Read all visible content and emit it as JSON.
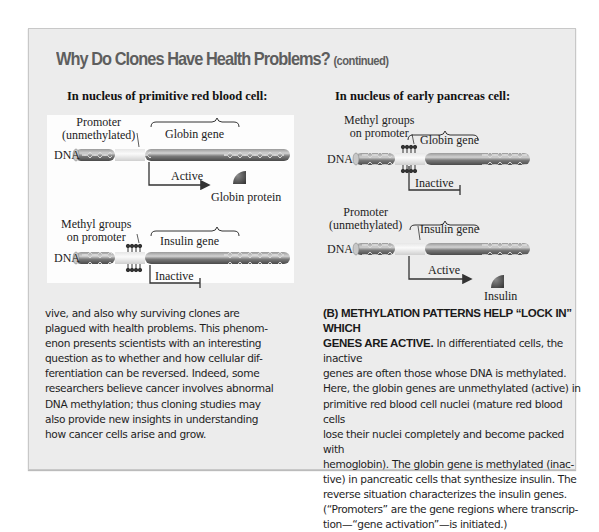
{
  "page": {
    "title": "Why Do Clones Have Health Problems?",
    "title_suffix": "(continued)"
  },
  "figure": {
    "left": {
      "heading": "In nucleus of primitive red blood cell:",
      "top_strand": {
        "dna_label": "DNA",
        "promoter_label_line1": "Promoter",
        "promoter_label_line2": "(unmethylated)",
        "gene_label": "Globin gene",
        "state_label": "Active",
        "product_label": "Globin protein",
        "methylated": false
      },
      "bottom_strand": {
        "dna_label": "DNA",
        "promoter_label_line1": "Methyl groups",
        "promoter_label_line2": "on promoter",
        "gene_label": "Insulin gene",
        "state_label": "Inactive",
        "methylated": true
      }
    },
    "right": {
      "heading": "In nucleus of early pancreas cell:",
      "top_strand": {
        "dna_label": "DNA",
        "promoter_label_line1": "Methyl groups",
        "promoter_label_line2": "on promoter",
        "gene_label": "Globin gene",
        "state_label": "Inactive",
        "methylated": true
      },
      "bottom_strand": {
        "dna_label": "DNA",
        "promoter_label_line1": "Promoter",
        "promoter_label_line2": "(unmethylated)",
        "gene_label": "Insulin gene",
        "state_label": "Active",
        "product_label": "Insulin",
        "methylated": false
      }
    }
  },
  "body_left": {
    "lines": [
      "vive, and also why surviving clones are",
      "plagued with health problems. This phenom-",
      "enon presents scientists with an interesting",
      "question as to whether and how cellular dif-",
      "ferentiation can be reversed. Indeed, some",
      "researchers believe cancer involves abnormal",
      "DNA methylation; thus cloning studies may",
      "also provide new insights in understanding",
      "how cancer cells arise and grow."
    ]
  },
  "caption_right": {
    "heading_line1": "(B) METHYLATION PATTERNS HELP “LOCK IN” WHICH",
    "heading_line2": "GENES ARE ACTIVE.",
    "line2_rest": " In differentiated cells, the inactive",
    "lines": [
      "genes are often those whose DNA is methylated.",
      "Here, the globin genes are unmethylated (active) in",
      "primitive red blood cell nuclei (mature red blood cells",
      "lose their nuclei completely and become packed with",
      "hemoglobin). The globin gene is methylated (inac-",
      "tive) in pancreatic cells that synthesize insulin. The",
      "reverse situation characterizes the insulin genes.",
      "(“Promoters” are the gene regions where transcrip-",
      "tion—“gene activation”—is initiated.)"
    ]
  },
  "colors": {
    "panel_bg": "#ececec",
    "title_gray": "#5e5e5e",
    "dna_dark": "#6f6f6f",
    "promoter_light": "#eeeeee",
    "protein": "#555555"
  }
}
